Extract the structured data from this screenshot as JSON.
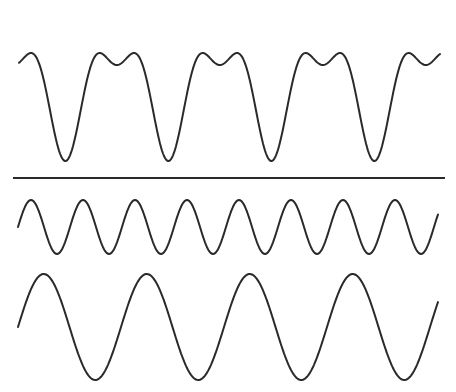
{
  "diagram": {
    "stroke_color": "#2a2a2a",
    "background": "#ffffff",
    "separator": {
      "x1": 13,
      "x2": 445,
      "y": 178
    },
    "waves": [
      {
        "id": "complex-wave",
        "role": "sum of fundamental and second harmonic",
        "x_start": 19,
        "x_end": 440,
        "center_y": 89,
        "period_px": 103,
        "components": [
          {
            "amplitude": 48,
            "phase": 0.3
          },
          {
            "amplitude": 24,
            "harmonic": 2,
            "phase": 0.85
          }
        ]
      },
      {
        "id": "harmonic-wave",
        "role": "second harmonic (double frequency)",
        "x_start": 18,
        "x_end": 438,
        "center_y": 227,
        "period_px": 52,
        "amplitude": 27,
        "cycles_visible": 8,
        "phase": 0.0
      },
      {
        "id": "fundamental-wave",
        "role": "fundamental frequency",
        "x_start": 18,
        "x_end": 438,
        "center_y": 327,
        "period_px": 103,
        "amplitude": 53,
        "cycles_visible": 4,
        "phase": 0.0
      }
    ]
  }
}
